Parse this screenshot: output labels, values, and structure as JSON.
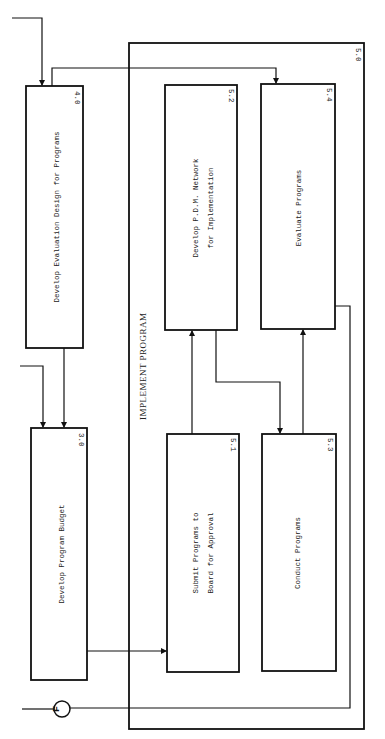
{
  "diagram": {
    "orientation": "rotated-90-clockwise",
    "colors": {
      "ink": "#111111",
      "background": "#ffffff"
    },
    "group": {
      "id": "5.0",
      "title": "IMPLEMENT PROGRAM"
    },
    "boxes": [
      {
        "id": "4.0",
        "label_lines": [
          "Develop Evaluation Design for Programs"
        ]
      },
      {
        "id": "3.0",
        "label_lines": [
          "Develop Program Budget"
        ]
      },
      {
        "id": "5.2",
        "label_lines": [
          "Develop P.D.M. Network",
          "for Implementation"
        ]
      },
      {
        "id": "5.4",
        "label_lines": [
          "Evaluate Programs"
        ]
      },
      {
        "id": "5.1",
        "label_lines": [
          "Submit Programs to",
          "Board for Approval"
        ]
      },
      {
        "id": "5.3",
        "label_lines": [
          "Conduct Programs"
        ]
      }
    ],
    "connector": {
      "label": "F"
    },
    "edges": [
      {
        "from": "input",
        "to": "4.0"
      },
      {
        "from": "4.0",
        "to": "3.0"
      },
      {
        "from": "input",
        "to": "3.0"
      },
      {
        "from": "4.0",
        "to": "5.4"
      },
      {
        "from": "3.0",
        "to": "5.1"
      },
      {
        "from": "5.1",
        "to": "5.2"
      },
      {
        "from": "5.2",
        "to": "5.3"
      },
      {
        "from": "5.3",
        "to": "5.4"
      },
      {
        "from": "5.4",
        "to": "F"
      },
      {
        "from": "5.0",
        "to": "F"
      }
    ]
  }
}
